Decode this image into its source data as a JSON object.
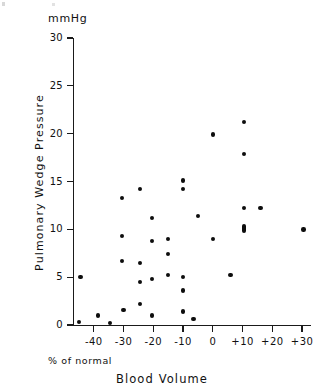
{
  "figure": {
    "unit_label": "mmHg",
    "y_axis_title": "Pulmonary Wedge Pressure",
    "x_axis_title": "Blood Volume",
    "x_axis_note": "% of normal"
  },
  "chart_data": {
    "type": "scatter",
    "title": "",
    "xlabel": "Blood Volume",
    "ylabel": "Pulmonary Wedge Pressure",
    "y_unit": "mmHg",
    "x_unit": "% of normal",
    "xlim": [
      -47,
      33
    ],
    "ylim": [
      0,
      30
    ],
    "grid": false,
    "legend": null,
    "xticks": [
      -40,
      -30,
      -20,
      -10,
      0,
      10,
      20,
      30
    ],
    "xtick_labels": [
      "-40",
      "-30",
      "-20",
      "-10",
      "0",
      "+10",
      "+20",
      "+30"
    ],
    "yticks": [
      0,
      5,
      10,
      15,
      20,
      25,
      30
    ],
    "ytick_labels": [
      "0",
      "5",
      "10",
      "15",
      "20",
      "25",
      "30"
    ],
    "points": [
      {
        "x": -44.5,
        "y": 5.0,
        "n": 1
      },
      {
        "x": -45.0,
        "y": 0.3,
        "n": 1
      },
      {
        "x": -38.5,
        "y": 1.0,
        "n": 1
      },
      {
        "x": -34.5,
        "y": 0.2,
        "n": 1
      },
      {
        "x": -30.5,
        "y": 13.3,
        "n": 1
      },
      {
        "x": -30.5,
        "y": 9.3,
        "n": 1
      },
      {
        "x": -30.5,
        "y": 6.7,
        "n": 1
      },
      {
        "x": -30.0,
        "y": 1.6,
        "n": 1
      },
      {
        "x": -24.5,
        "y": 14.2,
        "n": 1
      },
      {
        "x": -24.5,
        "y": 6.5,
        "n": 1
      },
      {
        "x": -24.5,
        "y": 4.5,
        "n": 1
      },
      {
        "x": -24.5,
        "y": 2.2,
        "n": 1
      },
      {
        "x": -20.5,
        "y": 11.2,
        "n": 1
      },
      {
        "x": -20.5,
        "y": 8.8,
        "n": 1
      },
      {
        "x": -20.5,
        "y": 4.8,
        "n": 1
      },
      {
        "x": -20.5,
        "y": 1.0,
        "n": 1
      },
      {
        "x": -15.0,
        "y": 9.0,
        "n": 1
      },
      {
        "x": -15.0,
        "y": 7.4,
        "n": 1
      },
      {
        "x": -15.0,
        "y": 5.2,
        "n": 1
      },
      {
        "x": -10.0,
        "y": 15.1,
        "n": 1
      },
      {
        "x": -10.0,
        "y": 14.2,
        "n": 1
      },
      {
        "x": -10.0,
        "y": 5.0,
        "n": 1
      },
      {
        "x": -10.0,
        "y": 3.6,
        "n": 1
      },
      {
        "x": -10.0,
        "y": 1.4,
        "n": 1
      },
      {
        "x": -6.5,
        "y": 0.6,
        "n": 1
      },
      {
        "x": -5.0,
        "y": 11.4,
        "n": 1
      },
      {
        "x": 0.0,
        "y": 19.9,
        "n": 1
      },
      {
        "x": 0.0,
        "y": 9.0,
        "n": 1
      },
      {
        "x": 6.0,
        "y": 5.2,
        "n": 1
      },
      {
        "x": 10.5,
        "y": 21.2,
        "n": 1
      },
      {
        "x": 10.5,
        "y": 17.9,
        "n": 1
      },
      {
        "x": 10.5,
        "y": 12.2,
        "n": 1
      },
      {
        "x": 10.5,
        "y": 10.1,
        "n": 2
      },
      {
        "x": 16.0,
        "y": 12.2,
        "n": 1
      },
      {
        "x": 30.5,
        "y": 10.0,
        "n": 1
      }
    ]
  }
}
